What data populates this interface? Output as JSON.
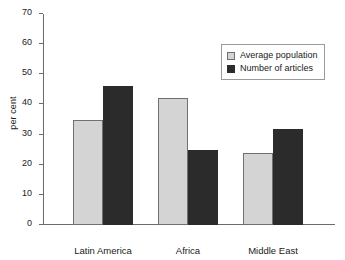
{
  "chart_data": {
    "type": "bar",
    "title": "",
    "xlabel": "",
    "ylabel": "per cent",
    "ylim": [
      0,
      70
    ],
    "ytick_step": 10,
    "yticks": [
      70,
      60,
      50,
      40,
      30,
      20,
      10,
      0
    ],
    "grid": false,
    "legend_position": "top-right",
    "categories": [
      "Latin America",
      "Africa",
      "Middle East"
    ],
    "series": [
      {
        "name": "Average population",
        "color": "#d4d4d4",
        "values": [
          35,
          42,
          24
        ]
      },
      {
        "name": "Number of articles",
        "color": "#2b2b2b",
        "values": [
          46,
          25,
          32
        ]
      }
    ]
  },
  "colors": {
    "background": "#ffffff",
    "axis": "#6b6b6b",
    "text": "#1a1a1a",
    "legend_border": "#9a9a9a",
    "bar_outline": "#707070"
  }
}
